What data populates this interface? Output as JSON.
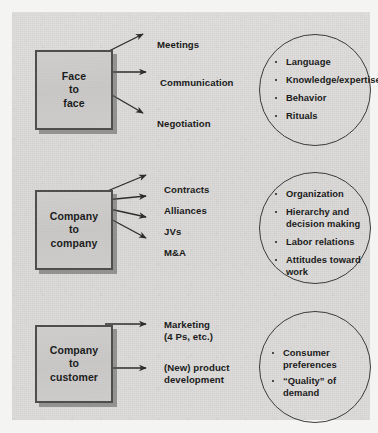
{
  "figure": {
    "background_color": "#d9d8d6",
    "page_color": "#f4f4f2",
    "box_fill": "#cbcac8",
    "line_color": "#3b3b3b"
  },
  "rows": [
    {
      "box_label": "Face\nto\nface",
      "outcomes": [
        "Meetings",
        "Communication",
        "Negotiation"
      ],
      "bubble_items": [
        "Language",
        "Knowledge/expertise",
        "Behavior",
        "Rituals"
      ]
    },
    {
      "box_label": "Company\nto\ncompany",
      "outcomes": [
        "Contracts",
        "Alliances",
        "JVs",
        "M&A"
      ],
      "bubble_items": [
        "Organization",
        "Hierarchy and\ndecision making",
        "Labor relations",
        "Attitudes toward\nwork"
      ]
    },
    {
      "box_label": "Company\nto\ncustomer",
      "outcomes": [
        "Marketing\n(4 Ps, etc.)",
        "(New) product\ndevelopment"
      ],
      "bubble_items": [
        "Consumer preferences",
        "“Quality” of demand"
      ]
    }
  ]
}
